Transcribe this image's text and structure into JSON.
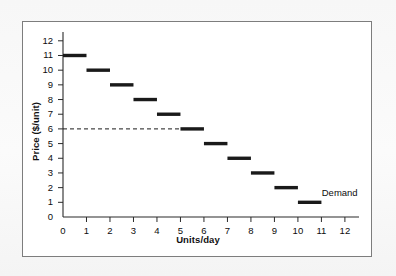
{
  "figure": {
    "background_color": "#ffffff",
    "border_color": "#7d7d7d",
    "annotation": "Demand"
  },
  "chart_data": {
    "type": "bar",
    "title": "",
    "xlabel": "Units/day",
    "ylabel": "Price ($/unit)",
    "xlim": [
      0,
      12.6
    ],
    "ylim": [
      0,
      12.6
    ],
    "xticks": [
      0,
      1,
      2,
      3,
      4,
      5,
      6,
      7,
      8,
      9,
      10,
      11,
      12
    ],
    "yticks": [
      0,
      1,
      2,
      3,
      4,
      5,
      6,
      7,
      8,
      9,
      10,
      11,
      12
    ],
    "xtick_labels": [
      "0",
      "1",
      "2",
      "3",
      "4",
      "5",
      "6",
      "7",
      "8",
      "9",
      "10",
      "11",
      "12"
    ],
    "ytick_labels": [
      "0",
      "1",
      "2",
      "3",
      "4",
      "5",
      "6",
      "7",
      "8",
      "9",
      "10",
      "11",
      "12"
    ],
    "grid": false,
    "legend": null,
    "series_name": "Demand",
    "series_color": "#1a1a1a",
    "categories": [
      "0-1",
      "1-2",
      "2-3",
      "3-4",
      "4-5",
      "5-6",
      "6-7",
      "7-8",
      "8-9",
      "9-10",
      "10-11"
    ],
    "x": [
      0,
      1,
      2,
      3,
      4,
      5,
      6,
      7,
      8,
      9,
      10
    ],
    "values": [
      11,
      10,
      9,
      8,
      7,
      6,
      5,
      4,
      3,
      2,
      1
    ],
    "steps": [
      {
        "x_start": 0,
        "x_end": 1,
        "price": 11
      },
      {
        "x_start": 1,
        "x_end": 2,
        "price": 10
      },
      {
        "x_start": 2,
        "x_end": 3,
        "price": 9
      },
      {
        "x_start": 3,
        "x_end": 4,
        "price": 8
      },
      {
        "x_start": 4,
        "x_end": 5,
        "price": 7
      },
      {
        "x_start": 5,
        "x_end": 6,
        "price": 6
      },
      {
        "x_start": 6,
        "x_end": 7,
        "price": 5
      },
      {
        "x_start": 7,
        "x_end": 8,
        "price": 4
      },
      {
        "x_start": 8,
        "x_end": 9,
        "price": 3
      },
      {
        "x_start": 9,
        "x_end": 10,
        "price": 2
      },
      {
        "x_start": 10,
        "x_end": 11,
        "price": 1
      }
    ],
    "annotations": [
      {
        "text": "Demand",
        "x": 11.1,
        "y": 1.55
      }
    ],
    "reference_lines": [
      {
        "orientation": "horizontal",
        "value": 6,
        "style": "dashed",
        "x_start": 0,
        "x_end": 5,
        "color": "#1a1a1a"
      }
    ]
  }
}
